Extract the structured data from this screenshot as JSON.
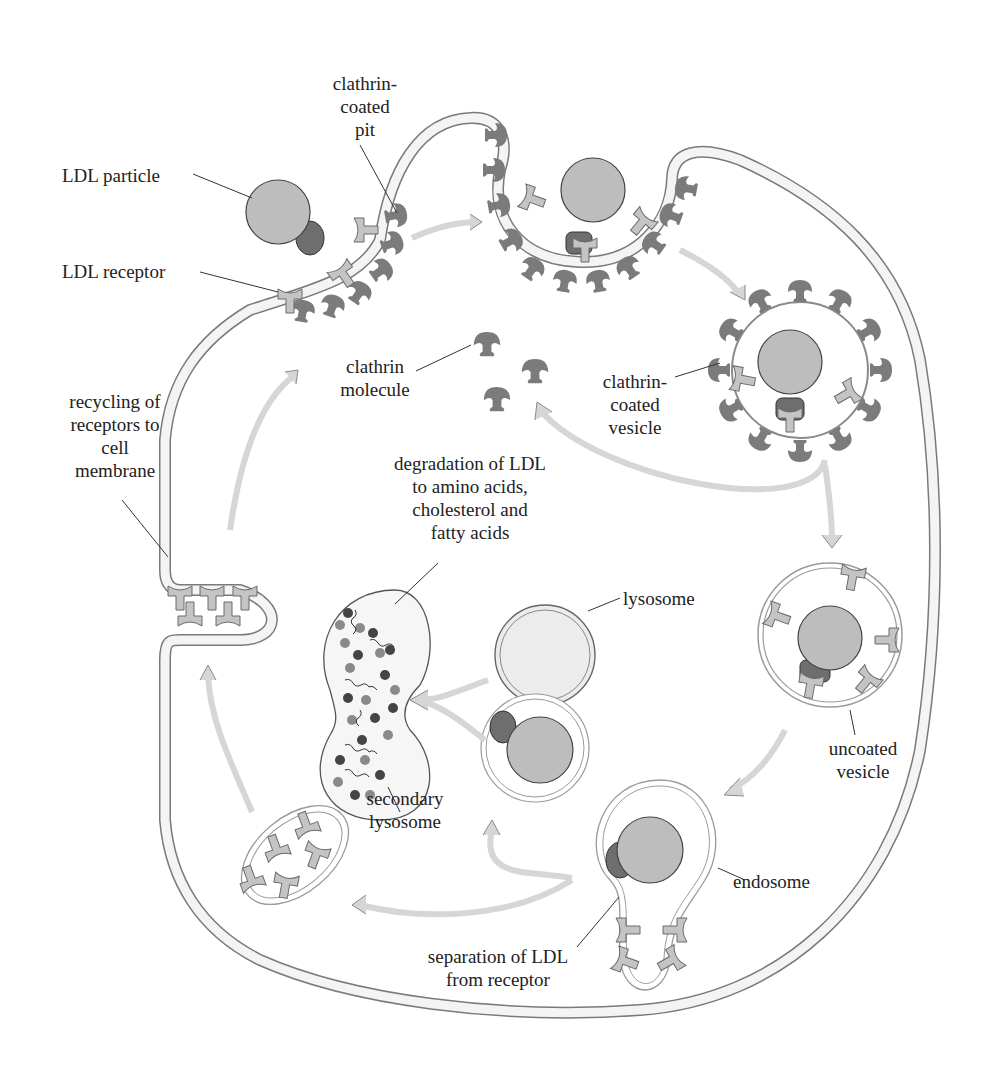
{
  "diagram": {
    "colors": {
      "background": "#ffffff",
      "membrane_fill": "#f4f4f4",
      "membrane_stroke": "#7a7a7a",
      "ldl_particle": "#bdbdbd",
      "ldl_protein": "#6e6e6e",
      "receptor": "#c4c4c4",
      "clathrin": "#7b7b7b",
      "arrow_fill": "#d6d6d6",
      "arrow_stroke": "#8a8a8a",
      "lysosome_fill": "#ececec",
      "text": "#222222"
    },
    "labels": {
      "clathrin_coated_pit": "clathrin-\ncoated\npit",
      "ldl_particle": "LDL particle",
      "ldl_receptor": "LDL receptor",
      "clathrin_molecule": "clathrin\nmolecule",
      "clathrin_coated_vesicle": "clathrin-\ncoated\nvesicle",
      "recycling": "recycling of\nreceptors to\ncell\nmembrane",
      "degradation": "degradation of LDL\nto amino acids,\ncholesterol and\nfatty acids",
      "lysosome": "lysosome",
      "uncoated_vesicle": "uncoated\nvesicle",
      "secondary_lysosome": "secondary\nlysosome",
      "endosome": "endosome",
      "separation": "separation of LDL\nfrom receptor"
    },
    "nodes": [
      {
        "id": "coated-pit",
        "label": "clathrin-coated pit"
      },
      {
        "id": "deep-pit",
        "label": "invaginated coated pit"
      },
      {
        "id": "coated-vesicle",
        "label": "clathrin-coated vesicle"
      },
      {
        "id": "uncoated-vesicle",
        "label": "uncoated vesicle"
      },
      {
        "id": "endosome",
        "label": "endosome"
      },
      {
        "id": "lysosome",
        "label": "lysosome"
      },
      {
        "id": "ldl-vesicle",
        "label": "LDL vesicle"
      },
      {
        "id": "secondary-lysosome",
        "label": "secondary lysosome"
      },
      {
        "id": "receptor-vesicle",
        "label": "receptor recycling vesicle"
      },
      {
        "id": "recycling-site",
        "label": "recycling of receptors to cell membrane"
      }
    ],
    "edges": [
      {
        "from": "coated-pit",
        "to": "deep-pit"
      },
      {
        "from": "deep-pit",
        "to": "coated-vesicle"
      },
      {
        "from": "coated-vesicle",
        "to": "uncoated-vesicle"
      },
      {
        "from": "coated-vesicle",
        "to": "clathrin-molecules"
      },
      {
        "from": "uncoated-vesicle",
        "to": "endosome"
      },
      {
        "from": "endosome",
        "to": "ldl-vesicle"
      },
      {
        "from": "endosome",
        "to": "receptor-vesicle"
      },
      {
        "from": "lysosome",
        "to": "secondary-lysosome"
      },
      {
        "from": "ldl-vesicle",
        "to": "secondary-lysosome"
      },
      {
        "from": "receptor-vesicle",
        "to": "recycling-site"
      },
      {
        "from": "recycling-site",
        "to": "coated-pit"
      }
    ]
  }
}
